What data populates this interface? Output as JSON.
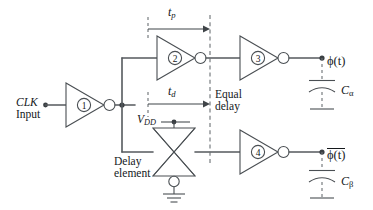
{
  "figure": {
    "kind": "circuit-diagram",
    "background": "#ffffff",
    "wire_color": "#555a5e",
    "text_color": "#14181b",
    "dash_color": "#6b7074"
  },
  "labels": {
    "clk_line1": "CLK",
    "clk_line2": "Input",
    "tp": "t",
    "tp_sub": "p",
    "td": "t",
    "td_sub": "d",
    "equal_line1": "Equal",
    "equal_line2": "delay",
    "vdd": "V",
    "vdd_sub": "DD",
    "delay_line1": "Delay",
    "delay_line2": "element",
    "phi": "ϕ(t)",
    "phi_bar": "ϕ(t)",
    "cap_alpha": "C",
    "cap_alpha_sub": "α",
    "cap_beta": "C",
    "cap_beta_sub": "β"
  },
  "inverters": [
    {
      "id": "inv1",
      "number": "①",
      "role": "input-buffer"
    },
    {
      "id": "inv2",
      "number": "②",
      "role": "upper-path-first"
    },
    {
      "id": "inv3",
      "number": "③",
      "role": "upper-path-output"
    },
    {
      "id": "inv4",
      "number": "④",
      "role": "lower-path-output"
    }
  ],
  "annotations": {
    "tp_arrow": {
      "from_x": 148,
      "to_x": 210,
      "y": 29
    },
    "td_arrow": {
      "from_x": 148,
      "to_x": 210,
      "y": 104
    },
    "reference_dashed_line_x": 210
  },
  "components": {
    "transmission_gate": "delay-element",
    "capacitors": [
      "C-alpha",
      "C-beta"
    ],
    "grounds": [
      "tg-ground",
      "ca-ground",
      "cb-ground"
    ]
  }
}
